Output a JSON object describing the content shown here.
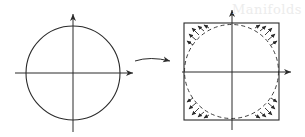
{
  "figure": {
    "ghost_text": "Manifolds",
    "colors": {
      "ink": "#2a2a2a",
      "background": "#ffffff"
    },
    "left_panel": {
      "shape": "circle",
      "center": [
        73,
        73
      ],
      "radius": 47
    },
    "right_panel": {
      "shape": "square",
      "x": 184,
      "y": 23,
      "width": 95,
      "height": 97,
      "inscribed_circle": "dashed"
    },
    "transform_arrow": {
      "shape": "curved-arrow",
      "from": [
        135,
        61
      ],
      "to": [
        171,
        61
      ]
    }
  }
}
